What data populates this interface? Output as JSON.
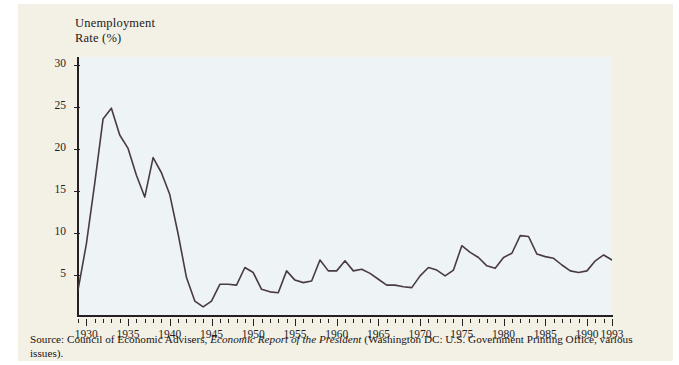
{
  "figure": {
    "axis_title": "Unemployment\nRate (%)",
    "source_prefix": "Source: Council of Economic Advisers, ",
    "source_italic": "Economic Report of the President",
    "source_suffix": " (Washington DC: U.S. Government Printing Office, various issues).",
    "line_color": "#4a3a42",
    "axis_color": "#241f22",
    "plot_background": "#eef3f5",
    "page_background": "#f3f0e6"
  },
  "chart_data": {
    "type": "line",
    "title": "",
    "xlabel": "",
    "ylabel": "Unemployment Rate (%)",
    "xlim": [
      1929,
      1993
    ],
    "ylim": [
      0,
      31
    ],
    "grid": false,
    "legend": "none",
    "ytick_labels": [
      "5",
      "10",
      "15",
      "20",
      "25",
      "30"
    ],
    "yticks": [
      5,
      10,
      15,
      20,
      25,
      30
    ],
    "xtick_labels": [
      "1930",
      "1935",
      "1940",
      "1945",
      "1950",
      "1955",
      "1960",
      "1965",
      "1970",
      "1975",
      "1980",
      "1985",
      "1990",
      "1993"
    ],
    "xticks": [
      1930,
      1935,
      1940,
      1945,
      1950,
      1955,
      1960,
      1965,
      1970,
      1975,
      1980,
      1985,
      1990,
      1993
    ],
    "xtick_minor_step": 1,
    "x": [
      1929,
      1930,
      1931,
      1932,
      1933,
      1934,
      1935,
      1936,
      1937,
      1938,
      1939,
      1940,
      1941,
      1942,
      1943,
      1944,
      1945,
      1946,
      1947,
      1948,
      1949,
      1950,
      1951,
      1952,
      1953,
      1954,
      1955,
      1956,
      1957,
      1958,
      1959,
      1960,
      1961,
      1962,
      1963,
      1964,
      1965,
      1966,
      1967,
      1968,
      1969,
      1970,
      1971,
      1972,
      1973,
      1974,
      1975,
      1976,
      1977,
      1978,
      1979,
      1980,
      1981,
      1982,
      1983,
      1984,
      1985,
      1986,
      1987,
      1988,
      1989,
      1990,
      1991,
      1992,
      1993
    ],
    "values": [
      3.2,
      8.7,
      15.9,
      23.6,
      24.9,
      21.7,
      20.1,
      16.9,
      14.3,
      19.0,
      17.2,
      14.6,
      9.9,
      4.7,
      1.9,
      1.2,
      1.9,
      3.9,
      3.9,
      3.8,
      5.9,
      5.3,
      3.3,
      3.0,
      2.9,
      5.5,
      4.4,
      4.1,
      4.3,
      6.8,
      5.5,
      5.5,
      6.7,
      5.5,
      5.7,
      5.2,
      4.5,
      3.8,
      3.8,
      3.6,
      3.5,
      4.9,
      5.9,
      5.6,
      4.9,
      5.6,
      8.5,
      7.7,
      7.1,
      6.1,
      5.8,
      7.1,
      7.6,
      9.7,
      9.6,
      7.5,
      7.2,
      7.0,
      6.2,
      5.5,
      5.3,
      5.5,
      6.7,
      7.4,
      6.8
    ],
    "series": [
      {
        "name": "Unemployment Rate (%)",
        "values": [
          3.2,
          8.7,
          15.9,
          23.6,
          24.9,
          21.7,
          20.1,
          16.9,
          14.3,
          19.0,
          17.2,
          14.6,
          9.9,
          4.7,
          1.9,
          1.2,
          1.9,
          3.9,
          3.9,
          3.8,
          5.9,
          5.3,
          3.3,
          3.0,
          2.9,
          5.5,
          4.4,
          4.1,
          4.3,
          6.8,
          5.5,
          5.5,
          6.7,
          5.5,
          5.7,
          5.2,
          4.5,
          3.8,
          3.8,
          3.6,
          3.5,
          4.9,
          5.9,
          5.6,
          4.9,
          5.6,
          8.5,
          7.7,
          7.1,
          6.1,
          5.8,
          7.1,
          7.6,
          9.7,
          9.6,
          7.5,
          7.2,
          7.0,
          6.2,
          5.5,
          5.3,
          5.5,
          6.7,
          7.4,
          6.8
        ]
      }
    ]
  }
}
